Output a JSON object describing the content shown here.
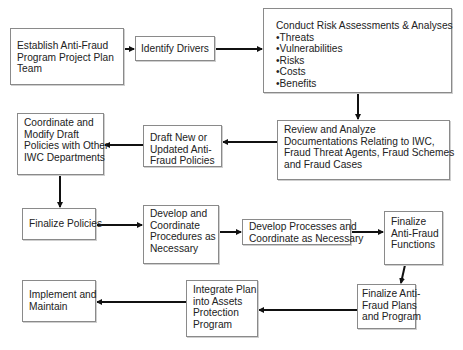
{
  "diagram": {
    "type": "flowchart",
    "nodes": [
      {
        "id": "establish",
        "lines": [
          "Establish Anti-Fraud",
          "Program Project Plan",
          "Team"
        ]
      },
      {
        "id": "identify",
        "lines": [
          "Identify Drivers"
        ]
      },
      {
        "id": "conduct",
        "lines": [
          "Conduct Risk  Assessments & Analyses",
          "•Threats",
          "•Vulnerabilities",
          "•Risks",
          "•Costs",
          "•Benefits"
        ]
      },
      {
        "id": "review",
        "lines": [
          "Review and Analyze",
          "Documentations Relating to IWC,",
          "Fraud Threat Agents, Fraud Schemes",
          "and Fraud Cases"
        ]
      },
      {
        "id": "draft",
        "lines": [
          "Draft New or",
          "Updated Anti-",
          "Fraud Policies"
        ]
      },
      {
        "id": "coordinate",
        "lines": [
          "Coordinate and",
          "Modify Draft",
          "Policies with Other",
          "IWC Departments"
        ]
      },
      {
        "id": "finalize_policies",
        "lines": [
          "Finalize Policies"
        ]
      },
      {
        "id": "develop_procedures",
        "lines": [
          "Develop and",
          "Coordinate",
          "Procedures as",
          "Necessary"
        ]
      },
      {
        "id": "develop_processes",
        "lines": [
          "Develop Processes and",
          "Coordinate as Necessary"
        ]
      },
      {
        "id": "finalize_functions",
        "lines": [
          "Finalize",
          "Anti-Fraud",
          "Functions"
        ]
      },
      {
        "id": "finalize_plans",
        "lines": [
          "Finalize Anti-",
          "Fraud Plans",
          "and Program"
        ]
      },
      {
        "id": "integrate",
        "lines": [
          "Integrate Plan",
          "into Assets",
          "Protection",
          "Program"
        ]
      },
      {
        "id": "implement",
        "lines": [
          "Implement and",
          "Maintain"
        ]
      }
    ],
    "edges": [
      {
        "from": "establish",
        "to": "identify"
      },
      {
        "from": "identify",
        "to": "conduct"
      },
      {
        "from": "conduct",
        "to": "review"
      },
      {
        "from": "review",
        "to": "draft"
      },
      {
        "from": "draft",
        "to": "coordinate"
      },
      {
        "from": "coordinate",
        "to": "finalize_policies"
      },
      {
        "from": "finalize_policies",
        "to": "develop_procedures"
      },
      {
        "from": "develop_procedures",
        "to": "develop_processes"
      },
      {
        "from": "develop_processes",
        "to": "finalize_functions"
      },
      {
        "from": "finalize_functions",
        "to": "finalize_plans"
      },
      {
        "from": "finalize_plans",
        "to": "integrate"
      },
      {
        "from": "integrate",
        "to": "implement"
      }
    ],
    "colors": {
      "border": "#8a8a8a",
      "arrow": "#111111",
      "text": "#222222",
      "background": "#ffffff"
    }
  }
}
